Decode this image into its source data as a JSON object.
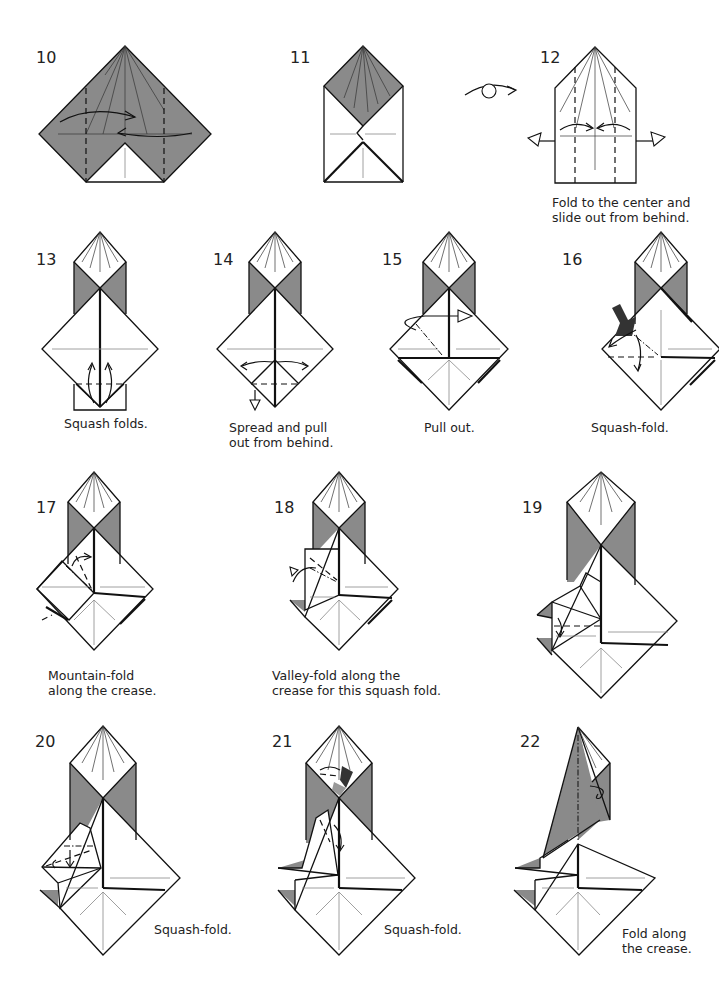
{
  "page": {
    "type": "origami-instructions",
    "colors": {
      "paper_color_side": "#8a8a8a",
      "paper_white_side": "#ffffff",
      "line": "#111111"
    }
  },
  "steps": [
    {
      "number": "10",
      "caption": ""
    },
    {
      "number": "11",
      "caption": ""
    },
    {
      "number": "12",
      "caption_lines": [
        "Fold to the center and",
        "slide out from behind."
      ]
    },
    {
      "number": "13",
      "caption_lines": [
        "Squash folds."
      ]
    },
    {
      "number": "14",
      "caption_lines": [
        "Spread and pull",
        "out from behind."
      ]
    },
    {
      "number": "15",
      "caption_lines": [
        "Pull out."
      ]
    },
    {
      "number": "16",
      "caption_lines": [
        "Squash-fold."
      ]
    },
    {
      "number": "17",
      "caption_lines": [
        "Mountain-fold",
        "along the crease."
      ]
    },
    {
      "number": "18",
      "caption_lines": [
        "Valley-fold along the",
        "crease for this squash fold."
      ]
    },
    {
      "number": "19",
      "caption": ""
    },
    {
      "number": "20",
      "caption_lines": [
        "Squash-fold."
      ]
    },
    {
      "number": "21",
      "caption_lines": [
        "Squash-fold."
      ]
    },
    {
      "number": "22",
      "caption_lines": [
        "Fold along",
        "the crease."
      ]
    }
  ],
  "symbols": {
    "turn_over": "turn-over-symbol",
    "valley_fold": "dashed-line",
    "mountain_fold": "dash-dot-line",
    "push_arrow": "squash-push-arrow"
  }
}
